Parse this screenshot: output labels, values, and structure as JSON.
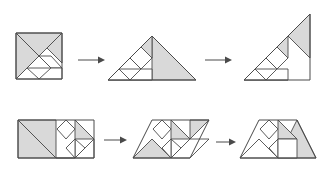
{
  "figure": {
    "background_color": "#ffffff",
    "fill_color": "#d9d9d9",
    "stroke_color": "#4a4a4a",
    "rows": [
      {
        "id": "row-1",
        "name": "square-to-triangle-to-right-triangle",
        "steps": [
          {
            "id": "r1s1",
            "shape_name": "square",
            "piece_count": 7
          },
          {
            "id": "r1s2",
            "shape_name": "large-triangle",
            "piece_count": 7
          },
          {
            "id": "r1s3",
            "shape_name": "tilted-right-triangle",
            "piece_count": 7
          }
        ],
        "arrows": [
          {
            "id": "r1a1",
            "direction": "right"
          },
          {
            "id": "r1a2",
            "direction": "right"
          }
        ]
      },
      {
        "id": "row-2",
        "name": "rectangle-to-parallelogram-to-trapezoid",
        "steps": [
          {
            "id": "r2s1",
            "shape_name": "rectangle",
            "piece_count": 7
          },
          {
            "id": "r2s2",
            "shape_name": "parallelogram",
            "piece_count": 7
          },
          {
            "id": "r2s3",
            "shape_name": "trapezoid",
            "piece_count": 7
          }
        ],
        "arrows": [
          {
            "id": "r2a1",
            "direction": "right"
          },
          {
            "id": "r2a2",
            "direction": "right"
          }
        ]
      }
    ]
  },
  "shapes": {
    "r1s1": {
      "label": "square",
      "pieces": [
        {
          "name": "large-triangle-left",
          "fill": "filled",
          "points": "16,33 16,79 39,56"
        },
        {
          "name": "large-triangle-top",
          "fill": "filled",
          "points": "16,33 62,33 39,56"
        },
        {
          "name": "medium-triangle-right",
          "fill": "filled",
          "points": "62,33 62,63 47,48"
        },
        {
          "name": "small-triangle-mid",
          "fill": "empty",
          "points": "39,56 51,68 27,68"
        },
        {
          "name": "small-triangle-lower",
          "fill": "empty",
          "points": "27,68 39,79 16,79"
        },
        {
          "name": "square-piece",
          "fill": "empty",
          "points": "39,56 51,68 62,68 51,56"
        },
        {
          "name": "parallelogram-piece",
          "fill": "empty",
          "points": "51,68 62,68 62,79 39,79"
        }
      ],
      "outline": "16,33 62,33 62,79 16,79"
    },
    "r1s2": {
      "label": "large-triangle",
      "pieces": [
        {
          "name": "large-triangle-right",
          "fill": "filled",
          "points": "152,36 152,80 196,80"
        },
        {
          "name": "large-triangle-lower-left",
          "fill": "empty",
          "points": "108,80 152,80 130,58"
        },
        {
          "name": "medium-triangle",
          "fill": "filled",
          "points": "152,36 152,58 130,58"
        },
        {
          "name": "small-triangle-a",
          "fill": "empty",
          "points": "130,58 141,69 119,69"
        },
        {
          "name": "small-triangle-b",
          "fill": "empty",
          "points": "119,69 130,80 108,80"
        },
        {
          "name": "square-piece",
          "fill": "empty",
          "points": "130,58 141,69 152,58 141,47"
        },
        {
          "name": "parallelogram-piece",
          "fill": "empty",
          "points": "130,80 141,69 152,69 152,80"
        }
      ],
      "outline": "108,80 196,80 152,36"
    },
    "r1s3": {
      "label": "tilted-right-triangle",
      "pieces": [
        {
          "name": "large-triangle-upper",
          "fill": "filled",
          "points": "310,14 288,36 310,58"
        },
        {
          "name": "large-triangle-lower",
          "fill": "empty",
          "points": "244,80 288,80 266,58"
        },
        {
          "name": "medium-triangle",
          "fill": "filled",
          "points": "288,36 288,58 266,58"
        },
        {
          "name": "small-triangle-a",
          "fill": "empty",
          "points": "266,58 277,69 255,69"
        },
        {
          "name": "small-triangle-b",
          "fill": "empty",
          "points": "255,69 266,80 244,80"
        },
        {
          "name": "square-piece",
          "fill": "empty",
          "points": "266,58 277,69 288,58 277,47"
        },
        {
          "name": "parallelogram-piece",
          "fill": "empty",
          "points": "266,80 277,69 288,69 288,80"
        }
      ],
      "outline": "244,80 310,80 310,14"
    },
    "r2s1": {
      "label": "rectangle",
      "pieces": [
        {
          "name": "large-triangle-left",
          "fill": "filled",
          "points": "18,120 18,158 56,158"
        },
        {
          "name": "large-triangle-top-right",
          "fill": "filled",
          "points": "18,120 56,120 56,158"
        },
        {
          "name": "medium-triangle-right",
          "fill": "filled",
          "points": "75,120 94,139 75,139"
        },
        {
          "name": "small-triangle-a",
          "fill": "empty",
          "points": "75,139 85,148 75,158"
        },
        {
          "name": "small-triangle-b",
          "fill": "empty",
          "points": "75,139 66,148 75,158"
        },
        {
          "name": "square-piece",
          "fill": "empty",
          "points": "66,120 75,129 66,139 57,129"
        },
        {
          "name": "parallelogram-piece",
          "fill": "empty",
          "points": "56,158 75,158 94,139 94,158"
        }
      ],
      "outline": "18,120 94,120 94,158 18,158"
    },
    "r2s2": {
      "label": "parallelogram",
      "pieces": [
        {
          "name": "large-triangle-left",
          "fill": "filled",
          "points": "133,158 152,139 171,158"
        },
        {
          "name": "large-triangle-right",
          "fill": "filled",
          "points": "190,120 209,120 190,139"
        },
        {
          "name": "medium-triangle",
          "fill": "filled",
          "points": "171,120 190,139 171,139"
        },
        {
          "name": "small-triangle-a",
          "fill": "empty",
          "points": "171,139 181,148 171,158"
        },
        {
          "name": "small-triangle-b",
          "fill": "empty",
          "points": "171,139 162,148 171,158"
        },
        {
          "name": "square-piece",
          "fill": "empty",
          "points": "162,120 171,129 162,139 153,129"
        },
        {
          "name": "parallelogram-piece",
          "fill": "empty",
          "points": "171,158 190,158 209,139 190,139"
        }
      ],
      "outline": "152,120 209,120 190,158 133,158"
    },
    "r2s3": {
      "label": "trapezoid",
      "pieces": [
        {
          "name": "large-triangle-left",
          "fill": "empty",
          "points": "240,158 259,139 278,158"
        },
        {
          "name": "large-triangle-right",
          "fill": "filled",
          "points": "297,120 316,158 278,158"
        },
        {
          "name": "medium-triangle",
          "fill": "filled",
          "points": "278,120 297,139 278,139"
        },
        {
          "name": "small-triangle-a",
          "fill": "empty",
          "points": "278,139 288,148 278,158"
        },
        {
          "name": "small-triangle-b",
          "fill": "empty",
          "points": "278,139 269,148 278,158"
        },
        {
          "name": "square-piece",
          "fill": "empty",
          "points": "269,120 278,129 269,139 260,129"
        },
        {
          "name": "parallelogram-piece",
          "fill": "empty",
          "points": "278,158 297,158 297,139 278,139"
        }
      ],
      "outline": "240,158 259,120 297,120 316,158"
    }
  },
  "arrows": {
    "r1a1": {
      "x1": 78,
      "y1": 60,
      "x2": 100,
      "y2": 60
    },
    "r1a2": {
      "x1": 205,
      "y1": 60,
      "x2": 232,
      "y2": 60
    },
    "r2a1": {
      "x1": 104,
      "y1": 140,
      "x2": 126,
      "y2": 140
    },
    "r2a2": {
      "x1": 216,
      "y1": 142,
      "x2": 234,
      "y2": 142
    }
  }
}
